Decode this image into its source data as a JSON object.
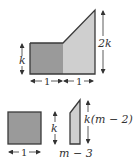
{
  "diagram": {
    "top_figure": {
      "left_height_label": "k",
      "right_height_label": "2k",
      "left_width_label": "1",
      "right_width_label": "1",
      "colors": {
        "dark_fill": "#9a9a9a",
        "light_fill": "#cfcfcf",
        "stroke": "#3a3a3a"
      }
    },
    "bottom_left_figure": {
      "width_label": "1",
      "height_label": "k",
      "colors": {
        "fill": "#9a9a9a",
        "stroke": "#3a3a3a"
      }
    },
    "bottom_right_figure": {
      "width_label": "m − 3",
      "height_label": "k(m − 2)",
      "colors": {
        "fill": "#cfcfcf",
        "stroke": "#3a3a3a"
      }
    }
  }
}
